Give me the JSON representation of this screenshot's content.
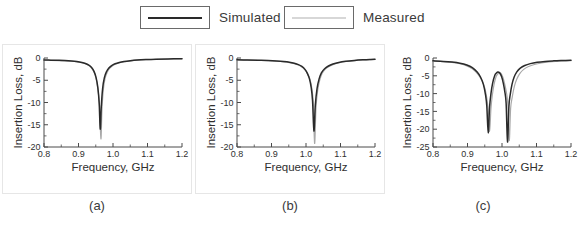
{
  "legend": {
    "entries": [
      {
        "label": "Simulated",
        "color": "#2a2a2a",
        "swatch_name": "legend-swatch-simulated"
      },
      {
        "label": "Measured",
        "color": "#b0b0b0",
        "swatch_name": "legend-swatch-measured"
      }
    ]
  },
  "captions": {
    "a": "(a)",
    "b": "(b)",
    "c": "(c)"
  },
  "axis": {
    "xlabel": "Frequency, GHz",
    "ylabel": "Insertion Loss, dB",
    "xticks": [
      "0.8",
      "0.9",
      "1.0",
      "1.1",
      "1.2"
    ],
    "yticks_ab": [
      "0",
      "-5",
      "-10",
      "-15",
      "-20"
    ],
    "yticks_c": [
      "0",
      "-5",
      "-10",
      "-15",
      "-20",
      "-25"
    ]
  },
  "colors": {
    "simulated": "#2a2a2a",
    "measured": "#a8a8a8",
    "axis": "#4a4a4a",
    "frame": "#e6e6e6"
  },
  "chart_data": [
    {
      "type": "line",
      "panel": "(a)",
      "title": "",
      "xlabel": "Frequency, GHz",
      "ylabel": "Insertion Loss, dB",
      "xlim": [
        0.8,
        1.2
      ],
      "ylim": [
        -20,
        0
      ],
      "xticks": [
        0.8,
        0.9,
        1.0,
        1.1,
        1.2
      ],
      "yticks": [
        0,
        -5,
        -10,
        -15,
        -20
      ],
      "grid": false,
      "legend_position": "top-shared",
      "resonances": [
        {
          "series": "Simulated",
          "center_ghz": 0.963,
          "depth_db": -16.0
        },
        {
          "series": "Measured",
          "center_ghz": 0.965,
          "depth_db": -18.2
        }
      ],
      "series": [
        {
          "name": "Simulated",
          "color": "#2a2a2a",
          "x": [
            0.8,
            0.82,
            0.84,
            0.86,
            0.88,
            0.895,
            0.91,
            0.92,
            0.93,
            0.938,
            0.945,
            0.951,
            0.956,
            0.96,
            0.963,
            0.966,
            0.97,
            0.975,
            0.981,
            0.988,
            0.996,
            1.006,
            1.018,
            1.032,
            1.05,
            1.07,
            1.095,
            1.125,
            1.16,
            1.2
          ],
          "y": [
            -0.45,
            -0.48,
            -0.52,
            -0.58,
            -0.68,
            -0.8,
            -1.0,
            -1.22,
            -1.62,
            -2.15,
            -3.0,
            -4.4,
            -6.6,
            -10.2,
            -16.0,
            -11.0,
            -6.8,
            -4.4,
            -3.1,
            -2.25,
            -1.7,
            -1.3,
            -1.0,
            -0.78,
            -0.6,
            -0.46,
            -0.35,
            -0.26,
            -0.2,
            -0.15
          ]
        },
        {
          "name": "Measured",
          "color": "#a8a8a8",
          "x": [
            0.8,
            0.82,
            0.84,
            0.86,
            0.88,
            0.895,
            0.91,
            0.92,
            0.93,
            0.938,
            0.945,
            0.951,
            0.956,
            0.961,
            0.965,
            0.968,
            0.972,
            0.977,
            0.983,
            0.99,
            0.998,
            1.008,
            1.02,
            1.034,
            1.052,
            1.072,
            1.097,
            1.127,
            1.162,
            1.2
          ],
          "y": [
            -0.5,
            -0.53,
            -0.57,
            -0.63,
            -0.73,
            -0.86,
            -1.06,
            -1.28,
            -1.7,
            -2.25,
            -3.15,
            -4.6,
            -6.9,
            -10.8,
            -18.2,
            -11.6,
            -7.1,
            -4.6,
            -3.25,
            -2.35,
            -1.78,
            -1.36,
            -1.05,
            -0.82,
            -0.63,
            -0.49,
            -0.38,
            -0.28,
            -0.22,
            -0.17
          ]
        }
      ]
    },
    {
      "type": "line",
      "panel": "(b)",
      "title": "",
      "xlabel": "Frequency, GHz",
      "ylabel": "Insertion Loss, dB",
      "xlim": [
        0.8,
        1.2
      ],
      "ylim": [
        -20,
        0
      ],
      "xticks": [
        0.8,
        0.9,
        1.0,
        1.1,
        1.2
      ],
      "yticks": [
        0,
        -5,
        -10,
        -15,
        -20
      ],
      "grid": false,
      "legend_position": "top-shared",
      "resonances": [
        {
          "series": "Simulated",
          "center_ghz": 1.023,
          "depth_db": -16.4
        },
        {
          "series": "Measured",
          "center_ghz": 1.025,
          "depth_db": -19.2
        }
      ],
      "series": [
        {
          "name": "Simulated",
          "color": "#2a2a2a",
          "x": [
            0.8,
            0.83,
            0.86,
            0.89,
            0.915,
            0.935,
            0.952,
            0.966,
            0.978,
            0.988,
            0.997,
            1.004,
            1.01,
            1.015,
            1.019,
            1.023,
            1.027,
            1.032,
            1.038,
            1.045,
            1.054,
            1.065,
            1.078,
            1.095,
            1.115,
            1.14,
            1.165,
            1.185,
            1.2
          ],
          "y": [
            -0.4,
            -0.44,
            -0.5,
            -0.58,
            -0.68,
            -0.8,
            -0.96,
            -1.18,
            -1.48,
            -1.9,
            -2.55,
            -3.45,
            -4.7,
            -6.6,
            -9.6,
            -16.4,
            -10.6,
            -6.9,
            -4.7,
            -3.3,
            -2.4,
            -1.8,
            -1.36,
            -1.0,
            -0.74,
            -0.54,
            -0.4,
            -0.32,
            -0.28
          ]
        },
        {
          "name": "Measured",
          "color": "#a8a8a8",
          "x": [
            0.8,
            0.83,
            0.86,
            0.89,
            0.915,
            0.935,
            0.952,
            0.966,
            0.978,
            0.988,
            0.997,
            1.005,
            1.012,
            1.017,
            1.021,
            1.025,
            1.029,
            1.034,
            1.04,
            1.047,
            1.056,
            1.067,
            1.08,
            1.097,
            1.117,
            1.142,
            1.167,
            1.187,
            1.2
          ],
          "y": [
            -0.44,
            -0.48,
            -0.54,
            -0.62,
            -0.73,
            -0.86,
            -1.03,
            -1.26,
            -1.57,
            -2.0,
            -2.68,
            -3.62,
            -4.92,
            -6.9,
            -10.0,
            -19.2,
            -11.1,
            -7.2,
            -4.9,
            -3.44,
            -2.5,
            -1.88,
            -1.42,
            -1.05,
            -0.78,
            -0.57,
            -0.43,
            -0.35,
            -0.31
          ]
        }
      ]
    },
    {
      "type": "line",
      "panel": "(c)",
      "title": "",
      "xlabel": "Frequency, GHz",
      "ylabel": "Insertion Loss, dB",
      "xlim": [
        0.8,
        1.2
      ],
      "ylim": [
        -25,
        0
      ],
      "xticks": [
        0.8,
        0.9,
        1.0,
        1.1,
        1.2
      ],
      "yticks": [
        0,
        -5,
        -10,
        -15,
        -20,
        -25
      ],
      "grid": false,
      "legend_position": "top-shared",
      "resonances": [
        {
          "series": "Simulated",
          "center_ghz": 0.96,
          "depth_db": -21.0
        },
        {
          "series": "Simulated",
          "center_ghz": 1.016,
          "depth_db": -23.6
        },
        {
          "series": "Measured",
          "center_ghz": 0.964,
          "depth_db": -20.6
        },
        {
          "series": "Measured",
          "center_ghz": 1.021,
          "depth_db": -23.2
        }
      ],
      "interpeak_maximum": {
        "center_ghz": 0.988,
        "value_db": -3.9
      },
      "series": [
        {
          "name": "Simulated",
          "color": "#2a2a2a",
          "x": [
            0.8,
            0.83,
            0.855,
            0.878,
            0.898,
            0.914,
            0.928,
            0.938,
            0.946,
            0.952,
            0.956,
            0.96,
            0.964,
            0.968,
            0.973,
            0.979,
            0.984,
            0.988,
            0.993,
            0.999,
            1.004,
            1.008,
            1.012,
            1.016,
            1.02,
            1.024,
            1.029,
            1.035,
            1.043,
            1.053,
            1.066,
            1.082,
            1.102,
            1.125,
            1.15,
            1.175,
            1.2
          ],
          "y": [
            -0.8,
            -0.95,
            -1.15,
            -1.45,
            -1.95,
            -2.7,
            -3.95,
            -5.4,
            -7.4,
            -10.2,
            -13.6,
            -21.0,
            -13.8,
            -10.0,
            -7.0,
            -4.9,
            -4.2,
            -3.9,
            -4.15,
            -5.3,
            -7.2,
            -9.4,
            -12.8,
            -23.6,
            -13.6,
            -10.2,
            -7.4,
            -5.4,
            -3.9,
            -2.85,
            -2.1,
            -1.58,
            -1.2,
            -0.95,
            -0.8,
            -0.7,
            -0.62
          ]
        },
        {
          "name": "Measured",
          "color": "#a8a8a8",
          "x": [
            0.8,
            0.83,
            0.855,
            0.878,
            0.898,
            0.915,
            0.93,
            0.941,
            0.95,
            0.956,
            0.96,
            0.964,
            0.968,
            0.972,
            0.977,
            0.983,
            0.988,
            0.992,
            0.997,
            1.003,
            1.008,
            1.013,
            1.017,
            1.021,
            1.025,
            1.03,
            1.036,
            1.043,
            1.052,
            1.063,
            1.077,
            1.094,
            1.114,
            1.137,
            1.16,
            1.182,
            1.2
          ],
          "y": [
            -0.85,
            -1.02,
            -1.25,
            -1.6,
            -2.2,
            -3.1,
            -4.55,
            -6.2,
            -8.4,
            -11.3,
            -14.6,
            -20.6,
            -14.2,
            -10.4,
            -7.4,
            -5.2,
            -4.45,
            -4.1,
            -4.35,
            -5.5,
            -7.4,
            -9.8,
            -13.2,
            -23.2,
            -14.2,
            -10.8,
            -7.9,
            -5.9,
            -4.3,
            -3.2,
            -2.4,
            -1.82,
            -1.4,
            -1.12,
            -0.95,
            -0.82,
            -0.74
          ]
        }
      ]
    }
  ]
}
